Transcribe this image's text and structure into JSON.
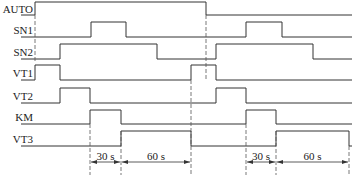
{
  "diagram": {
    "type": "timing-diagram",
    "signals": [
      {
        "name": "AUTO",
        "low_y": 15,
        "high_y": 2,
        "edges": [
          [
            35,
            "high"
          ],
          [
            206,
            "low"
          ]
        ],
        "start": "low"
      },
      {
        "name": "SN1",
        "low_y": 37,
        "high_y": 22,
        "edges": [
          [
            91,
            "high"
          ],
          [
            126,
            "low"
          ],
          [
            246,
            "high"
          ],
          [
            282,
            "low"
          ]
        ],
        "start": "low"
      },
      {
        "name": "SN2",
        "low_y": 59,
        "high_y": 44,
        "edges": [
          [
            60,
            "high"
          ],
          [
            157,
            "low"
          ],
          [
            216,
            "high"
          ],
          [
            313,
            "low"
          ]
        ],
        "start": "low"
      },
      {
        "name": "VT1",
        "low_y": 80,
        "high_y": 65,
        "edges": [
          [
            35,
            "high"
          ],
          [
            60,
            "low"
          ],
          [
            191,
            "high"
          ],
          [
            216,
            "low"
          ]
        ],
        "start": "low"
      },
      {
        "name": "VT2",
        "low_y": 103,
        "high_y": 88,
        "edges": [
          [
            60,
            "high"
          ],
          [
            90,
            "low"
          ],
          [
            216,
            "high"
          ],
          [
            246,
            "low"
          ]
        ],
        "start": "low"
      },
      {
        "name": "KM",
        "low_y": 124,
        "high_y": 110,
        "edges": [
          [
            90,
            "high"
          ],
          [
            121,
            "low"
          ],
          [
            246,
            "high"
          ],
          [
            276,
            "low"
          ]
        ],
        "start": "low"
      },
      {
        "name": "VT3",
        "low_y": 146,
        "high_y": 131,
        "edges": [
          [
            121,
            "high"
          ],
          [
            191,
            "low"
          ],
          [
            276,
            "high"
          ],
          [
            349,
            "low"
          ]
        ],
        "start": "low"
      }
    ],
    "dashed_lines": [
      {
        "x": 35,
        "y1": 15,
        "y2": 62
      },
      {
        "x": 90,
        "y1": 124,
        "y2": 175
      },
      {
        "x": 121,
        "y1": 131,
        "y2": 175
      },
      {
        "x": 191,
        "y1": 80,
        "y2": 175
      },
      {
        "x": 206,
        "y1": 15,
        "y2": 80
      },
      {
        "x": 246,
        "y1": 124,
        "y2": 175
      },
      {
        "x": 276,
        "y1": 131,
        "y2": 175
      },
      {
        "x": 349,
        "y1": 146,
        "y2": 175
      }
    ],
    "dimensions": [
      {
        "label": "30 s",
        "x1": 90,
        "x2": 121,
        "y": 162
      },
      {
        "label": "60 s",
        "x1": 121,
        "x2": 191,
        "y": 162
      },
      {
        "label": "30 s",
        "x1": 246,
        "x2": 276,
        "y": 162
      },
      {
        "label": "60 s",
        "x1": 276,
        "x2": 349,
        "y": 162
      }
    ],
    "x_start": 35,
    "x_end": 352
  },
  "labels": {
    "auto": "AUTO",
    "sn1": "SN1",
    "sn2": "SN2",
    "vt1": "VT1",
    "vt2": "VT2",
    "km": "KM",
    "vt3": "VT3",
    "dim1": "30 s",
    "dim2": "60 s",
    "dim3": "30 s",
    "dim4": "60 s"
  }
}
